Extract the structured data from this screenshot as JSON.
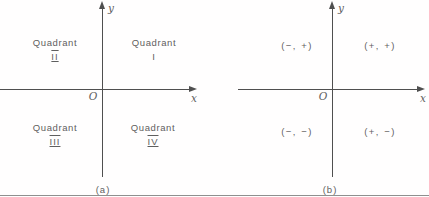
{
  "figure": {
    "colors": {
      "line": "#4f4f4f",
      "text": "#5f5f5f",
      "background": "#fffefe"
    },
    "diagrams": [
      {
        "id": "a",
        "caption": "(a)",
        "axis_labels": {
          "x": "x",
          "y": "y",
          "origin": "O"
        },
        "quadrants": {
          "q2": {
            "line1": "Quadrant",
            "numeral": "II"
          },
          "q1": {
            "line1": "Quadrant",
            "numeral": "I"
          },
          "q3": {
            "line1": "Quadrant",
            "numeral": "III"
          },
          "q4": {
            "line1": "Quadrant",
            "numeral": "IV"
          }
        }
      },
      {
        "id": "b",
        "caption": "(b)",
        "axis_labels": {
          "x": "x",
          "y": "y",
          "origin": "O"
        },
        "quadrants": {
          "q2": "(−, +)",
          "q1": "(+, +)",
          "q3": "(−, −)",
          "q4": "(+, −)"
        }
      }
    ]
  }
}
